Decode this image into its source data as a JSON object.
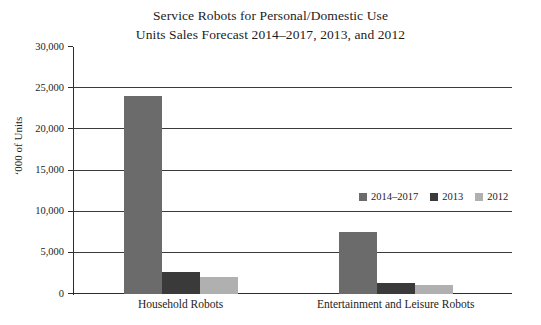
{
  "chart_data": {
    "type": "bar",
    "title": "Service Robots for Personal/Domestic Use\nUnits Sales Forecast 2014–2017, 2013, and 2012",
    "title_lines": [
      "Service Robots for Personal/Domestic Use",
      "Units Sales Forecast 2014–2017, 2013, and 2012"
    ],
    "xlabel": "",
    "ylabel": "‘000 of Units",
    "categories": [
      "Household Robots",
      "Entertainment and Leisure Robots"
    ],
    "series": [
      {
        "name": "2014–2017",
        "color": "#6b6b6b",
        "values": [
          24000,
          7500
        ]
      },
      {
        "name": "2013",
        "color": "#3a3a3a",
        "values": [
          2650,
          1300
        ]
      },
      {
        "name": "2012",
        "color": "#b0b0b0",
        "values": [
          2100,
          1100
        ]
      }
    ],
    "ylim": [
      0,
      30000
    ],
    "ytick_values": [
      0,
      5000,
      10000,
      15000,
      20000,
      25000,
      30000
    ],
    "ytick_labels": [
      "0",
      "5,000",
      "10,000",
      "15,000",
      "20,000",
      "25,000",
      "30,000"
    ],
    "grid": true,
    "legend_position": "inside-center-right",
    "annotations": []
  },
  "style": {
    "plot_background": "#ffffff",
    "axis_color": "#2c2c2c",
    "grid_color": "#3a3a3a",
    "text_color": "#1c1c1c"
  }
}
